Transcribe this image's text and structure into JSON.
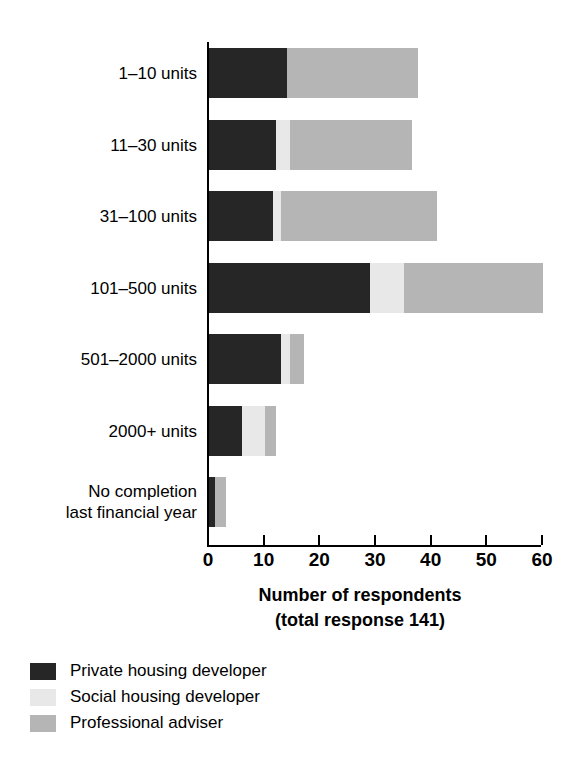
{
  "chart_data": {
    "type": "bar",
    "orientation": "horizontal",
    "stacked": true,
    "title": "",
    "xlabel": "Number of respondents\n(total response 141)",
    "xlabel_line1": "Number of respondents",
    "xlabel_line2": "(total response 141)",
    "ylabel": "Size band",
    "xlim": [
      0,
      60
    ],
    "xticks": [
      0,
      10,
      20,
      30,
      40,
      50,
      60
    ],
    "grid": false,
    "legend_position": "bottom-left",
    "categories": [
      "1–10 units",
      "11–30 units",
      "31–100 units",
      "101–500 units",
      "501–2000 units",
      "2000+ units",
      "No completion\nlast financial year"
    ],
    "series": [
      {
        "name": "Private housing developer",
        "color": "#262626",
        "values": [
          14,
          12,
          11.5,
          29,
          13,
          6,
          1
        ]
      },
      {
        "name": "Social housing developer",
        "color": "#e8e8e8",
        "values": [
          0,
          2.5,
          1.5,
          6,
          1.5,
          4,
          0
        ]
      },
      {
        "name": "Professional adviser",
        "color": "#b5b5b5",
        "values": [
          23.5,
          22,
          28,
          25,
          2.5,
          2,
          2
        ]
      }
    ],
    "totals": [
      37.5,
      36.5,
      41,
      60,
      17,
      12,
      3
    ]
  },
  "legend": {
    "items": [
      {
        "label": "Private housing developer",
        "color": "#262626"
      },
      {
        "label": "Social housing developer",
        "color": "#e8e8e8"
      },
      {
        "label": "Professional adviser",
        "color": "#b5b5b5"
      }
    ]
  }
}
